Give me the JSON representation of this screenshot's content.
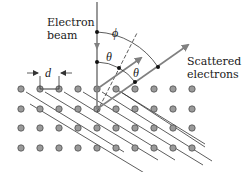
{
  "labels": {
    "beam_line1": "Electron",
    "beam_line2": "beam",
    "scattered_line1": "Scattered",
    "scattered_line2": "electrons",
    "spacing": "d",
    "phi": "ϕ",
    "theta_left": "θ",
    "theta_right": "θ"
  },
  "lattice": {
    "rows_y": [
      89,
      109,
      128,
      148
    ],
    "cols_x": [
      21,
      40,
      59,
      78,
      97,
      116,
      135,
      154,
      173,
      192
    ],
    "atom_radius": 3.2,
    "atom_fill": "#9a9a9a",
    "atom_stroke": "#444444"
  },
  "colors": {
    "beam": "#808080",
    "lines": "#333333",
    "text": "#1a1a1a"
  }
}
